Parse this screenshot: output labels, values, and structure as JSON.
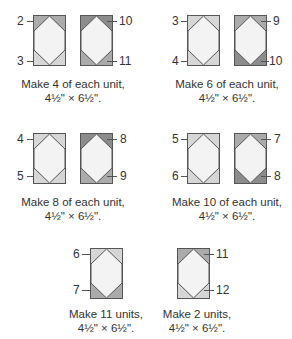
{
  "colors": {
    "border": "#555555",
    "center": "#f3f3f3",
    "light": "#d6d6d6",
    "medium": "#ababab",
    "dark": "#8c8c8c"
  },
  "groups": [
    {
      "caption_line1": "Make 4 of each unit,",
      "caption_line2": "4½\" × 6½\".",
      "units": [
        {
          "top_label": "2",
          "bottom_label": "3",
          "label_side": "left",
          "top_color": "medium",
          "bottom_color": "light"
        },
        {
          "top_label": "10",
          "bottom_label": "11",
          "label_side": "right",
          "top_color": "dark",
          "bottom_color": "medium"
        }
      ]
    },
    {
      "caption_line1": "Make 6 of each unit,",
      "caption_line2": "4½\" × 6½\".",
      "units": [
        {
          "top_label": "3",
          "bottom_label": "4",
          "label_side": "left",
          "top_color": "light",
          "bottom_color": "light"
        },
        {
          "top_label": "9",
          "bottom_label": "10",
          "label_side": "right",
          "top_color": "medium",
          "bottom_color": "dark"
        }
      ]
    },
    {
      "caption_line1": "Make 8 of each unit,",
      "caption_line2": "4½\" × 6½\".",
      "units": [
        {
          "top_label": "4",
          "bottom_label": "5",
          "label_side": "left",
          "top_color": "light",
          "bottom_color": "light"
        },
        {
          "top_label": "8",
          "bottom_label": "9",
          "label_side": "right",
          "top_color": "dark",
          "bottom_color": "medium"
        }
      ]
    },
    {
      "caption_line1": "Make 10 of each unit,",
      "caption_line2": "4½\" × 6½\".",
      "units": [
        {
          "top_label": "5",
          "bottom_label": "6",
          "label_side": "left",
          "top_color": "light",
          "bottom_color": "light"
        },
        {
          "top_label": "7",
          "bottom_label": "8",
          "label_side": "right",
          "top_color": "medium",
          "bottom_color": "dark"
        }
      ]
    },
    {
      "caption_line1": "Make 11 units,",
      "caption_line2": "4½\" × 6½\".",
      "units": [
        {
          "top_label": "6",
          "bottom_label": "7",
          "label_side": "left",
          "top_color": "light",
          "bottom_color": "medium"
        }
      ]
    },
    {
      "caption_line1": "Make 2 units,",
      "caption_line2": "4½\" × 6½\".",
      "units": [
        {
          "top_label": "11",
          "bottom_label": "12",
          "label_side": "right",
          "top_color": "medium",
          "bottom_color": "light"
        }
      ]
    }
  ]
}
